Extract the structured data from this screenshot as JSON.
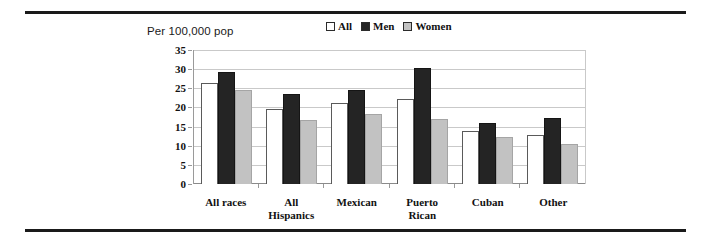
{
  "figure": {
    "axis_title": "Per 100,000 pop"
  },
  "legend": {
    "items": [
      {
        "label": "All",
        "color": "#ffffff"
      },
      {
        "label": "Men",
        "color": "#242424"
      },
      {
        "label": "Women",
        "color": "#c2c2c2"
      }
    ]
  },
  "chart_data": {
    "type": "bar",
    "title": "",
    "subtitle": "",
    "xlabel": "",
    "ylabel": "Per 100,000 pop",
    "ylim": [
      0,
      35
    ],
    "yticks": [
      0,
      5,
      10,
      15,
      20,
      25,
      30,
      35
    ],
    "ytick_labels": [
      "0",
      "5",
      "10",
      "15",
      "20",
      "25",
      "30",
      "35"
    ],
    "grid": true,
    "legend_position": "top-center",
    "categories": [
      "All races",
      "All Hispanics",
      "Mexican",
      "Puerto Rican",
      "Cuban",
      "Other"
    ],
    "category_lines": [
      [
        "All races"
      ],
      [
        "All",
        "Hispanics"
      ],
      [
        "Mexican"
      ],
      [
        "Puerto",
        "Rican"
      ],
      [
        "Cuban"
      ],
      [
        "Other"
      ]
    ],
    "series": [
      {
        "name": "All",
        "color": "#ffffff",
        "values": [
          26.5,
          19.6,
          21.2,
          22.1,
          13.9,
          12.8
        ]
      },
      {
        "name": "Men",
        "color": "#242424",
        "values": [
          29.3,
          23.6,
          24.5,
          30.2,
          15.9,
          17.2
        ]
      },
      {
        "name": "Women",
        "color": "#c2c2c2",
        "values": [
          24.5,
          16.7,
          18.3,
          17.0,
          12.3,
          10.4
        ]
      }
    ]
  }
}
